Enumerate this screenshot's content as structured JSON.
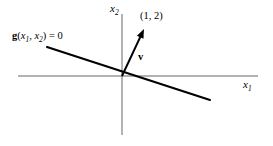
{
  "figure": {
    "type": "diagram",
    "background_color": "#ffffff",
    "ink_color": "#000000",
    "axis_color": "#555555",
    "width": 273,
    "height": 146
  },
  "axes": {
    "x_axis": {
      "label_var": "x",
      "label_sub": "1",
      "label_text": "x1",
      "y_pixel": 76,
      "x_start": 18,
      "x_end": 258
    },
    "y_axis": {
      "label_var": "x",
      "label_sub": "2",
      "label_text": "x2",
      "x_pixel": 122,
      "y_start": 14,
      "y_end": 135
    },
    "origin": {
      "x": 122,
      "y": 76
    }
  },
  "constraint": {
    "label_g": "g",
    "label_open": "(",
    "label_var1": "x",
    "label_sub1": "1",
    "label_comma": ", ",
    "label_var2": "x",
    "label_sub2": "2",
    "label_close": ")",
    "label_equals": " = 0",
    "full_text": "g(x1, x2) = 0",
    "line_from": {
      "x": 47,
      "y": 47
    },
    "line_to": {
      "x": 210,
      "y": 100
    },
    "stroke_width": 2.1
  },
  "vector": {
    "label": "v",
    "point_label": "(1, 2)",
    "components": [
      1,
      2
    ],
    "tail": {
      "x": 122,
      "y": 76
    },
    "tip": {
      "x": 144,
      "y": 29
    },
    "stroke_width": 2.0
  },
  "chart_data": {
    "type": "line",
    "title": "",
    "xlabel": "x1",
    "ylabel": "x2",
    "annotations": [
      "g(x1, x2) = 0",
      "(1, 2)",
      "v"
    ],
    "series": [
      {
        "name": "g(x1, x2) = 0",
        "description": "constraint line through the origin with negative slope",
        "x": [
          -4.8,
          5.5
        ],
        "y": [
          1.5,
          -1.5
        ]
      },
      {
        "name": "v",
        "description": "gradient vector arrow from origin toward (1, 2)",
        "x": [
          0,
          1
        ],
        "y": [
          0,
          2
        ]
      }
    ],
    "grid": false,
    "legend": "none"
  }
}
